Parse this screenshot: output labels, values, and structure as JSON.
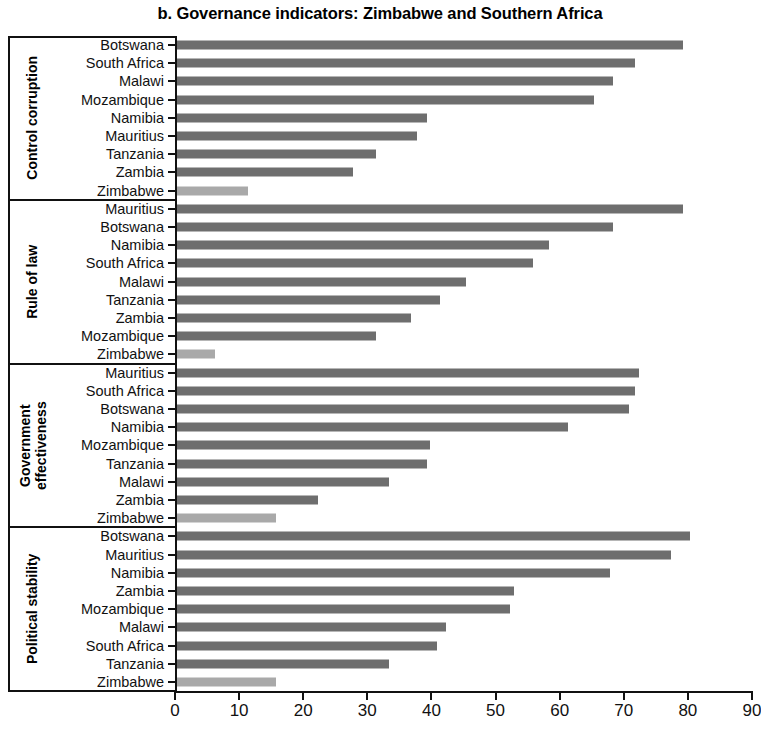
{
  "chart_data": {
    "type": "bar",
    "orientation": "horizontal",
    "title": "b. Governance indicators: Zimbabwe and Southern Africa",
    "xlabel": "",
    "ylabel": "",
    "xlim": [
      0,
      90
    ],
    "xticks": [
      0,
      10,
      20,
      30,
      40,
      50,
      60,
      70,
      80,
      90
    ],
    "grid": false,
    "legend": null,
    "colors": {
      "other_countries": "#6e6e6e",
      "zimbabwe": "#a9a9a9",
      "axis": "#111111",
      "background": "#ffffff"
    },
    "groups": [
      {
        "name": "Control corruption",
        "categories": [
          "Botswana",
          "South Africa",
          "Malawi",
          "Mozambique",
          "Namibia",
          "Mauritius",
          "Tanzania",
          "Zambia",
          "Zimbabwe"
        ],
        "values": [
          79,
          71.5,
          68,
          65,
          39,
          37.5,
          31,
          27.5,
          11
        ],
        "highlight": "Zimbabwe"
      },
      {
        "name": "Rule of law",
        "categories": [
          "Mauritius",
          "Botswana",
          "Namibia",
          "South Africa",
          "Malawi",
          "Tanzania",
          "Zambia",
          "Mozambique",
          "Zimbabwe"
        ],
        "values": [
          79,
          68,
          58,
          55.5,
          45,
          41,
          36.5,
          31,
          6
        ],
        "highlight": "Zimbabwe"
      },
      {
        "name": "Government effectiveness",
        "categories": [
          "Mauritius",
          "South Africa",
          "Botswana",
          "Namibia",
          "Mozambique",
          "Tanzania",
          "Malawi",
          "Zambia",
          "Zimbabwe"
        ],
        "values": [
          72,
          71.5,
          70.5,
          61,
          39.5,
          39,
          33,
          22,
          15.5
        ],
        "highlight": "Zimbabwe"
      },
      {
        "name": "Political stability",
        "categories": [
          "Botswana",
          "Mauritius",
          "Namibia",
          "Zambia",
          "Mozambique",
          "Malawi",
          "South Africa",
          "Tanzania",
          "Zimbabwe"
        ],
        "values": [
          80,
          77,
          67.5,
          52.5,
          52,
          42,
          40.5,
          33,
          15.5
        ],
        "highlight": "Zimbabwe"
      }
    ]
  }
}
